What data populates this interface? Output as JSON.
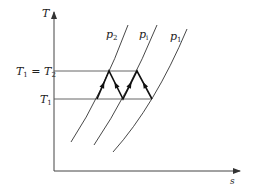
{
  "diagram": {
    "type": "T-s diagram",
    "axes": {
      "y_label": "T",
      "x_label": "s"
    },
    "temperature_levels": [
      {
        "label_main": "T",
        "label_sub": "1",
        "label_eq": " = ",
        "label_main2": "T",
        "label_sub2": "2",
        "full": "T1 = T2"
      },
      {
        "label_main": "T",
        "label_sub": "1",
        "full": "T1"
      }
    ],
    "isobars": [
      {
        "label_main": "p",
        "label_sub": "2",
        "full": "p2"
      },
      {
        "label_main": "p",
        "label_sub": "i",
        "full": "pi"
      },
      {
        "label_main": "p",
        "label_sub": "1",
        "full": "p1"
      }
    ],
    "process_path": {
      "description": "Zigzag compression/intercooling path between T1 and T1=T2 levels across isobars",
      "arrows": "up-left and down-right along segments"
    },
    "colors": {
      "line": "#333333",
      "path": "#111111",
      "background": "#ffffff"
    }
  }
}
